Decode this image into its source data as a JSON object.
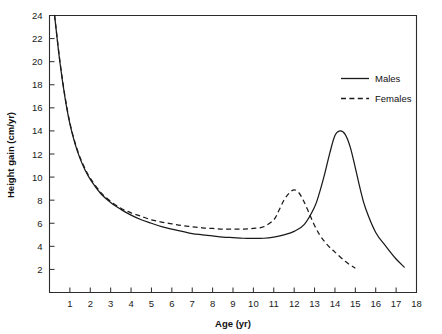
{
  "chart_data": {
    "type": "line",
    "title": "",
    "xlabel": "Age (yr)",
    "ylabel": "Height gain (cm/yr)",
    "xlim": [
      0,
      18
    ],
    "ylim": [
      0,
      24
    ],
    "grid": false,
    "legend_position": "top-right",
    "x_ticks": [
      1,
      2,
      3,
      4,
      5,
      6,
      7,
      8,
      9,
      10,
      11,
      12,
      13,
      14,
      15,
      16,
      17,
      18
    ],
    "x_tick_labels": [
      "1",
      "2",
      "3",
      "4",
      "5",
      "6",
      "7",
      "8",
      "9",
      "10",
      "11",
      "12",
      "13",
      "14",
      "15",
      "16",
      "17",
      "18"
    ],
    "y_ticks": [
      2,
      4,
      6,
      8,
      10,
      12,
      14,
      16,
      18,
      20,
      22,
      24
    ],
    "y_tick_labels": [
      "2",
      "4",
      "6",
      "8",
      "10",
      "12",
      "14",
      "16",
      "18",
      "20",
      "22",
      "24"
    ],
    "series": [
      {
        "name": "Males",
        "style": "solid",
        "color": "#1a1a1a",
        "x": [
          0.25,
          0.5,
          0.75,
          1.0,
          1.25,
          1.5,
          1.75,
          2.0,
          2.5,
          3.0,
          3.5,
          4.0,
          4.5,
          5.0,
          5.5,
          6.0,
          6.5,
          7.0,
          7.5,
          8.0,
          8.5,
          9.0,
          9.5,
          10.0,
          10.5,
          11.0,
          11.5,
          12.0,
          12.5,
          13.0,
          13.25,
          13.5,
          13.75,
          14.0,
          14.25,
          14.5,
          14.75,
          15.0,
          15.25,
          15.5,
          16.0,
          16.5,
          17.0,
          17.4
        ],
        "y": [
          24.0,
          20.1,
          17.0,
          14.6,
          12.9,
          11.6,
          10.6,
          9.8,
          8.6,
          7.8,
          7.2,
          6.7,
          6.3,
          6.0,
          5.7,
          5.5,
          5.3,
          5.1,
          5.0,
          4.9,
          4.8,
          4.75,
          4.7,
          4.7,
          4.7,
          4.8,
          5.0,
          5.3,
          5.9,
          7.4,
          8.7,
          10.3,
          12.1,
          13.6,
          14.0,
          13.7,
          12.6,
          10.8,
          8.9,
          7.3,
          5.2,
          4.0,
          2.9,
          2.2
        ]
      },
      {
        "name": "Females",
        "style": "dashed",
        "color": "#1a1a1a",
        "x": [
          0.25,
          0.5,
          0.75,
          1.0,
          1.25,
          1.5,
          1.75,
          2.0,
          2.5,
          3.0,
          3.5,
          4.0,
          4.5,
          5.0,
          5.5,
          6.0,
          6.5,
          7.0,
          7.5,
          8.0,
          8.5,
          9.0,
          9.5,
          10.0,
          10.5,
          11.0,
          11.25,
          11.5,
          11.75,
          12.0,
          12.25,
          12.5,
          12.75,
          13.0,
          13.25,
          13.5,
          13.75,
          14.0,
          14.5,
          15.0
        ],
        "y": [
          24.0,
          20.2,
          17.1,
          14.7,
          13.0,
          11.7,
          10.7,
          9.9,
          8.7,
          7.9,
          7.3,
          6.9,
          6.6,
          6.3,
          6.1,
          5.95,
          5.8,
          5.7,
          5.6,
          5.55,
          5.5,
          5.5,
          5.5,
          5.55,
          5.7,
          6.3,
          7.1,
          8.0,
          8.6,
          8.9,
          8.6,
          7.8,
          6.8,
          5.8,
          5.0,
          4.4,
          3.9,
          3.5,
          2.7,
          2.1
        ]
      }
    ],
    "annotations": {
      "male_peak_age": 14.25,
      "male_peak_value": 14.0,
      "female_peak_age": 12.0,
      "female_peak_value": 8.9
    }
  },
  "legend": {
    "entries": [
      {
        "label": "Males",
        "style": "solid"
      },
      {
        "label": "Females",
        "style": "dashed"
      }
    ]
  }
}
